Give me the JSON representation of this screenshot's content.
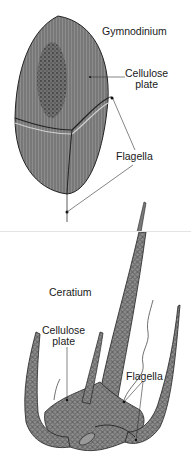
{
  "diagrams": [
    {
      "name": "Gymnodinium",
      "labels": {
        "title": "Gymnodinium",
        "cellulose_line1": "Cellulose",
        "cellulose_line2": "plate",
        "flagella": "Flagella"
      }
    },
    {
      "name": "Ceratium",
      "labels": {
        "title": "Ceratium",
        "cellulose_line1": "Cellulose",
        "cellulose_line2": "plate",
        "flagella": "Flagella"
      }
    }
  ],
  "colors": {
    "cell_fill": "#8a8a8a",
    "cell_stroke": "#2a2a2a",
    "nucleus": "#555555",
    "label_text": "#1a1a1a",
    "leader_line": "#333333"
  }
}
